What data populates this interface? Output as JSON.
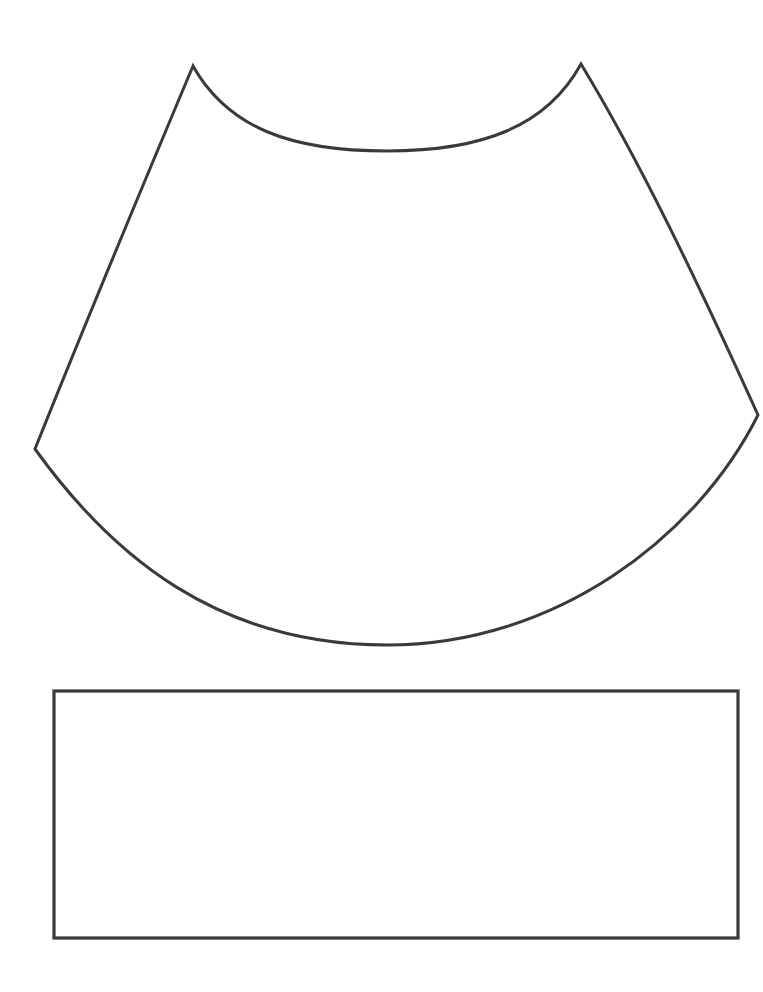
{
  "page": {
    "kind": "line-drawing",
    "background_color": "#ffffff",
    "width": 763,
    "height": 992
  },
  "style": {
    "stroke_color": "#3a3a3a",
    "fill_color": "none",
    "stroke_width": 3,
    "rect_stroke_width": 3.2
  },
  "shapes": [
    {
      "id": "cone-skirt",
      "name": "curved-skirt-shape",
      "description": "Annulus sector / cone-net shape with concave top arc, concave bottom arc and two nearly straight slanted sides meeting at sharp cusps",
      "stroke_color": "#3a3a3a",
      "stroke_width": 3,
      "path": "M 193 66 C 228 128 291 151 387 151 C 483 151 547 126 581 64 C 641 163 700 287 758 415 C 697 537 556 645 387 645 C 218 645 112 556 35 449 C 87 319 140 192 193 66 Z",
      "vertices": {
        "top_left_cusp": [
          193,
          66
        ],
        "top_right_cusp": [
          581,
          64
        ],
        "right_vertex": [
          758,
          415
        ],
        "left_vertex": [
          35,
          449
        ]
      },
      "arcs": {
        "top_arc_lowest_point": [
          387,
          151
        ],
        "bottom_arc_lowest_point": [
          387,
          645
        ]
      }
    },
    {
      "id": "band-rectangle",
      "name": "rectangle-strip",
      "description": "Empty rectangular band below the curved shape",
      "stroke_color": "#3a3a3a",
      "stroke_width": 3.2,
      "x": 54,
      "y": 691,
      "width": 684,
      "height": 247,
      "corners": {
        "top_left": [
          54,
          691
        ],
        "top_right": [
          738,
          691
        ],
        "bottom_right": [
          738,
          938
        ],
        "bottom_left": [
          54,
          938
        ]
      }
    }
  ]
}
